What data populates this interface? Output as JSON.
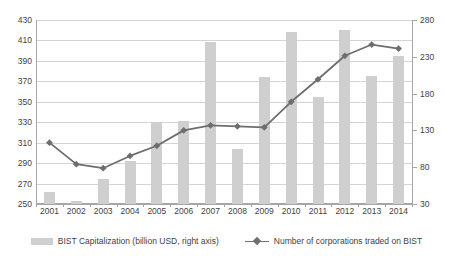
{
  "chart_data": {
    "type": "bar",
    "title": "",
    "subtitle": "",
    "xlabel": "",
    "ylabel": "",
    "grid": true,
    "legend_position": "bottom",
    "categories": [
      "2001",
      "2002",
      "2003",
      "2004",
      "2005",
      "2006",
      "2007",
      "2008",
      "2009",
      "2010",
      "2011",
      "2012",
      "2013",
      "2014"
    ],
    "left_axis": {
      "label": "",
      "ticks": [
        250,
        270,
        290,
        310,
        330,
        350,
        370,
        390,
        410,
        430
      ],
      "ylim": [
        250,
        430
      ],
      "assigned_series": "Number of corporations traded on BIST"
    },
    "right_axis": {
      "label": "",
      "ticks": [
        30,
        80,
        130,
        180,
        230,
        280
      ],
      "ylim": [
        30,
        280
      ],
      "assigned_series": "BIST Capitalization (billion USD, right axis)"
    },
    "series": [
      {
        "name": "BIST Capitalization (billion USD, right axis)",
        "type": "bar",
        "axis": "right",
        "color": "#cfcfcf",
        "values": [
          47,
          34,
          64,
          88,
          142,
          143,
          250,
          105,
          203,
          264,
          176,
          266,
          204,
          231
        ]
      },
      {
        "name": "Number of corporations traded on BIST",
        "type": "line",
        "axis": "left",
        "color": "#6e6e6e",
        "marker": "diamond",
        "values": [
          310,
          289,
          285,
          297,
          307,
          322,
          327,
          326,
          325,
          350,
          372,
          395,
          406,
          402
        ]
      }
    ],
    "bar_values_left_scale": [
      260,
      252,
      274,
      292,
      331,
      332,
      410,
      305,
      377,
      421,
      356,
      422,
      378,
      398
    ]
  },
  "legend": {
    "items": [
      {
        "label": "BIST Capitalization (billion USD, right axis)",
        "marker": "bar-swatch",
        "color": "#cfcfcf"
      },
      {
        "label": "Number of corporations traded on BIST",
        "marker": "line-diamond-swatch",
        "color": "#6e6e6e"
      }
    ]
  },
  "colors": {
    "bar": "#cfcfcf",
    "line": "#6e6e6e",
    "grid": "#d4d4d4",
    "axis": "#a6a6a6",
    "text": "#3f3f3f",
    "background": "#ffffff"
  }
}
